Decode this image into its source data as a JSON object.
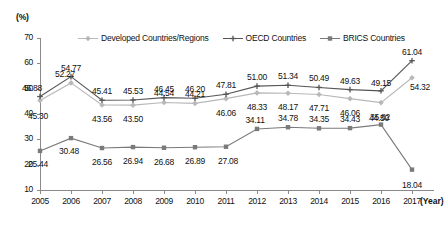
{
  "chart_data": {
    "type": "line",
    "title": "",
    "xlabel": "(Year)",
    "ylabel": "(%)",
    "ylim": [
      10,
      70
    ],
    "ytick_labels": [
      "70",
      "60",
      "50",
      "40",
      "30",
      "20",
      "10"
    ],
    "ytick_values": [
      70,
      60,
      50,
      40,
      30,
      20,
      10
    ],
    "grid": false,
    "legend_position": "top-center",
    "categories": [
      "2005",
      "2006",
      "2007",
      "2008",
      "2009",
      "2010",
      "2011",
      "2012",
      "2013",
      "2014",
      "2015",
      "2016",
      "2017"
    ],
    "x": [
      2005,
      2006,
      2007,
      2008,
      2009,
      2010,
      2011,
      2012,
      2013,
      2014,
      2015,
      2016,
      2017
    ],
    "series": [
      {
        "name": "Developed Countries/Regions",
        "color": "#b8b8b8",
        "marker": "diamond",
        "values": [
          45.3,
          52.27,
          43.56,
          43.5,
          44.54,
          44.21,
          46.06,
          48.33,
          48.17,
          47.71,
          46.06,
          44.5,
          54.32
        ],
        "labels": [
          "45.30",
          "52.27",
          "43.56",
          "43.50",
          "44.54",
          "44.21",
          "46.06",
          "48.33",
          "48.17",
          "47.71",
          "46.06",
          "44.50",
          "54.32"
        ]
      },
      {
        "name": "OECD Countries",
        "color": "#555555",
        "marker": "cross",
        "values": [
          46.88,
          54.77,
          45.41,
          45.53,
          46.45,
          46.2,
          47.81,
          51.0,
          51.34,
          50.49,
          49.63,
          49.15,
          61.04
        ],
        "labels": [
          "46.88",
          "54.77",
          "45.41",
          "45.53",
          "46.45",
          "46.20",
          "47.81",
          "51.00",
          "51.34",
          "50.49",
          "49.63",
          "49.15",
          "61.04"
        ]
      },
      {
        "name": "BRICS Countries",
        "color": "#7a7a7a",
        "marker": "square",
        "values": [
          25.44,
          30.48,
          26.56,
          26.94,
          26.68,
          26.89,
          27.08,
          34.11,
          34.78,
          34.35,
          34.43,
          35.82,
          18.04
        ],
        "labels": [
          "25.44",
          "30.48",
          "26.56",
          "26.94",
          "26.68",
          "26.89",
          "27.08",
          "34.11",
          "34.78",
          "34.35",
          "34.43",
          "35.82",
          "18.04"
        ]
      }
    ]
  }
}
